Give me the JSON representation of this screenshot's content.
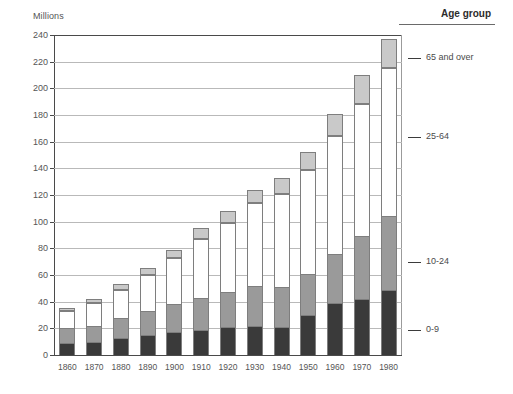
{
  "units_label": "Millions",
  "legend": {
    "title": "Age group",
    "items": [
      {
        "label": "65 and over",
        "color": "#c9c9c9",
        "y": 58
      },
      {
        "label": "25-64",
        "color": "#ffffff",
        "y": 137
      },
      {
        "label": "10-24",
        "color": "#9a9a9a",
        "y": 262
      },
      {
        "label": "0-9",
        "color": "#3a3a3a",
        "y": 330
      }
    ]
  },
  "chart_data": {
    "type": "bar",
    "title": "",
    "xlabel": "",
    "ylabel": "Millions",
    "ylim": [
      0,
      240
    ],
    "ytick_step": 20,
    "grid": true,
    "stacked": true,
    "legend_position": "right",
    "categories": [
      "1860",
      "1870",
      "1880",
      "1890",
      "1900",
      "1910",
      "1920",
      "1930",
      "1940",
      "1950",
      "1960",
      "1970",
      "1980"
    ],
    "series": [
      {
        "name": "0-9",
        "color": "#3a3a3a",
        "values": [
          9,
          10,
          13,
          15,
          17,
          19,
          21,
          22,
          21,
          30,
          39,
          42,
          49
        ]
      },
      {
        "name": "10-24",
        "color": "#9a9a9a",
        "values": [
          11,
          12,
          15,
          18,
          21,
          24,
          26,
          30,
          30,
          31,
          37,
          47,
          55
        ]
      },
      {
        "name": "25-64",
        "color": "#ffffff",
        "values": [
          13,
          17,
          21,
          27,
          35,
          44,
          52,
          62,
          70,
          78,
          88,
          99,
          111
        ]
      },
      {
        "name": "65 and over",
        "color": "#c9c9c9",
        "values": [
          2,
          3,
          4,
          5,
          6,
          8,
          9,
          10,
          12,
          13,
          17,
          22,
          22
        ]
      }
    ],
    "totals": [
      35,
      42,
      53,
      65,
      79,
      95,
      108,
      124,
      133,
      152,
      181,
      210,
      237
    ],
    "ytick_labels": [
      "0",
      "20",
      "40",
      "60",
      "80",
      "100",
      "120",
      "140",
      "160",
      "180",
      "200",
      "220",
      "240"
    ]
  }
}
